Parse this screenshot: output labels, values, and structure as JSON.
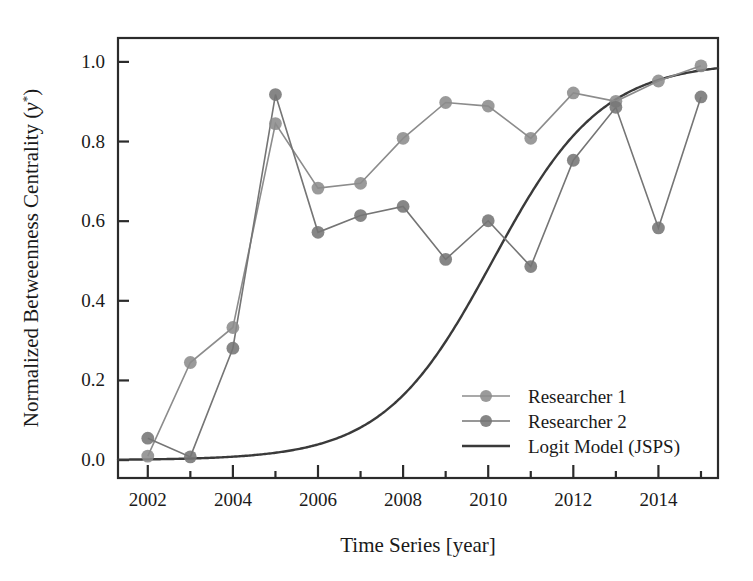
{
  "chart_data": {
    "type": "line",
    "title": "",
    "xlabel": "Time Series [year]",
    "ylabel": "Normalized Betweenness Centrality (y*)",
    "ylabel_main": "Normalized Betweenness Centrality (",
    "ylabel_var": "y",
    "ylabel_sup": "*",
    "ylabel_tail": ")",
    "x": [
      2002,
      2003,
      2004,
      2005,
      2006,
      2007,
      2008,
      2009,
      2010,
      2011,
      2012,
      2013,
      2014,
      2015
    ],
    "xlim": [
      2001.3,
      2015.4
    ],
    "ylim": [
      -0.045,
      1.06
    ],
    "xticks": [
      2002,
      2004,
      2006,
      2008,
      2010,
      2012,
      2014
    ],
    "xticklabels": [
      "2002",
      "2004",
      "2006",
      "2008",
      "2010",
      "2012",
      "2014"
    ],
    "xminorticks": [
      2003,
      2005,
      2007,
      2009,
      2011,
      2013,
      2015
    ],
    "yticks": [
      0.0,
      0.2,
      0.4,
      0.6,
      0.8,
      1.0
    ],
    "yticklabels": [
      "0.0",
      "0.2",
      "0.4",
      "0.6",
      "0.8",
      "1.0"
    ],
    "grid": false,
    "legend_position": "lower right",
    "series": [
      {
        "name": "Researcher 1",
        "marker": "circle",
        "color": "#8c8c8c",
        "values": [
          0.01,
          0.245,
          0.333,
          0.845,
          0.683,
          0.695,
          0.808,
          0.898,
          0.889,
          0.808,
          0.922,
          0.901,
          0.952,
          0.99
        ]
      },
      {
        "name": "Researcher 2",
        "marker": "circle",
        "color": "#757575",
        "values": [
          0.055,
          0.008,
          0.281,
          0.918,
          0.572,
          0.614,
          0.637,
          0.504,
          0.601,
          0.486,
          0.753,
          0.886,
          0.583,
          0.912
        ]
      },
      {
        "name": "Logit Model (JSPS)",
        "marker": "none",
        "color": "#3a3a3a",
        "model": "logistic",
        "L": 1.0,
        "k": 0.78,
        "x0": 2010.1,
        "values": [
          0.0165,
          0.0355,
          0.0745,
          0.151,
          0.276,
          0.443,
          0.617,
          0.762,
          0.862,
          0.923,
          0.958,
          0.978,
          0.989,
          0.995
        ]
      }
    ]
  },
  "legend": {
    "items": [
      {
        "label": "Researcher 1",
        "style": "line-marker",
        "color": "#8c8c8c"
      },
      {
        "label": "Researcher 2",
        "style": "line-marker",
        "color": "#757575"
      },
      {
        "label": "Logit Model (JSPS)",
        "style": "line",
        "color": "#3a3a3a"
      }
    ]
  },
  "colors": {
    "axis": "#2b2b2b",
    "text": "#1a1a1a",
    "background": "#ffffff",
    "series1": "#8c8c8c",
    "series2": "#757575",
    "model": "#3a3a3a"
  }
}
